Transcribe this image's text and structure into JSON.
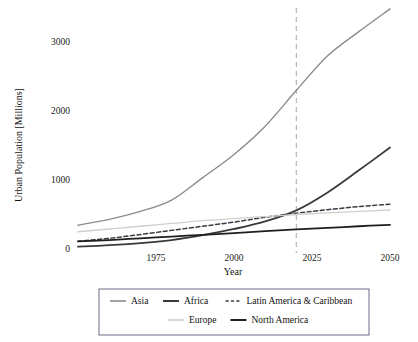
{
  "chart_data": {
    "type": "line",
    "title": "",
    "xlabel": "Year",
    "ylabel": "Urban Population [Millions]",
    "xlim": [
      1950,
      2050
    ],
    "ylim": [
      -120,
      3600
    ],
    "grid": false,
    "legend_position": "below",
    "xticks": [
      1975,
      2000,
      2025,
      2050
    ],
    "yticks": [
      0,
      1000,
      2000,
      3000
    ],
    "xtick_labels": [
      "1975",
      "2000",
      "2025",
      "2050"
    ],
    "ytick_labels": [
      "0",
      "1000",
      "2000",
      "3000"
    ],
    "annotations": [
      {
        "name": "present-year-marker",
        "type": "vline",
        "x": 2020,
        "style": "dashed",
        "color": "#b9b9b9"
      }
    ],
    "x": [
      1950,
      1960,
      1970,
      1980,
      1990,
      2000,
      2010,
      2020,
      2030,
      2040,
      2050
    ],
    "series": [
      {
        "name": "Asia",
        "color": "#8c8c8c",
        "dash": "solid",
        "width": 1.4,
        "values": [
          345,
          430,
          545,
          710,
          1035,
          1370,
          1780,
          2300,
          2800,
          3150,
          3480
        ]
      },
      {
        "name": "Africa",
        "color": "#3a3a3a",
        "dash": "solid",
        "width": 1.8,
        "values": [
          33,
          55,
          85,
          130,
          200,
          290,
          400,
          560,
          820,
          1140,
          1470
        ]
      },
      {
        "name": "Latin America & Caribbean",
        "color": "#3a3a46",
        "dash": "dashed",
        "width": 1.5,
        "values": [
          112,
          155,
          210,
          270,
          330,
          390,
          460,
          520,
          570,
          615,
          650
        ]
      },
      {
        "name": "Europe",
        "color": "#cfcfcf",
        "dash": "solid",
        "width": 1.3,
        "values": [
          250,
          290,
          330,
          370,
          410,
          440,
          470,
          500,
          525,
          545,
          565
        ]
      },
      {
        "name": "North America",
        "color": "#1f1f1f",
        "dash": "solid",
        "width": 1.8,
        "values": [
          110,
          130,
          155,
          180,
          205,
          230,
          260,
          285,
          305,
          330,
          350
        ]
      }
    ]
  },
  "axes": {
    "ylabel": "Urban Population [Millions]",
    "xlabel": "Year"
  },
  "legend": {
    "entries": [
      {
        "label": "Asia",
        "color": "#8c8c8c",
        "dash": "solid",
        "width": 1.6
      },
      {
        "label": "Africa",
        "color": "#3a3a3a",
        "dash": "solid",
        "width": 2.0
      },
      {
        "label": "Latin America & Caribbean",
        "color": "#3a3a46",
        "dash": "dashed",
        "width": 1.6
      },
      {
        "label": "Europe",
        "color": "#cfcfcf",
        "dash": "solid",
        "width": 1.6
      },
      {
        "label": "North America",
        "color": "#1f1f1f",
        "dash": "solid",
        "width": 2.0
      }
    ]
  }
}
